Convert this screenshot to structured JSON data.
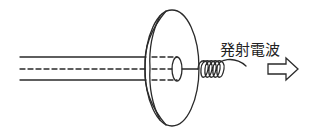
{
  "diagram": {
    "title": "",
    "stroke_color": "#2a2a2a",
    "background": "#ffffff",
    "components": {
      "cable": {
        "type": "coaxial-feed-line",
        "dashed_center": true
      },
      "reflector": {
        "type": "parabolic-dish"
      },
      "feed": {
        "type": "cylinder-feed"
      },
      "helix": {
        "type": "helical-coil",
        "turns": 5
      },
      "arrow": {
        "type": "hollow-arrow",
        "direction": "right"
      }
    },
    "labels": {
      "emitted_wave": "発射電波"
    }
  }
}
